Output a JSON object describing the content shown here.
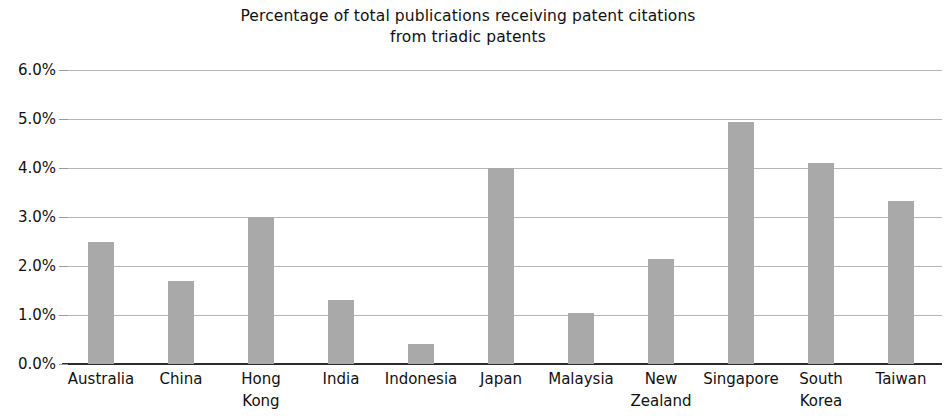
{
  "chart_data": {
    "type": "bar",
    "title": "Percentage of total publications receiving patent citations\nfrom triadic patents",
    "title_line1": "Percentage of total publications receiving patent citations",
    "title_line2": "from triadic patents",
    "xlabel": "",
    "ylabel": "",
    "ylim": [
      0,
      6
    ],
    "ytick_labels": [
      "6.0%",
      "5.0%",
      "4.0%",
      "3.0%",
      "2.0%",
      "1.0%",
      "0.0%"
    ],
    "ytick_values": [
      6.0,
      5.0,
      4.0,
      3.0,
      2.0,
      1.0,
      0.0
    ],
    "grid": true,
    "legend": "none",
    "bar_color": "#a9a9a9",
    "categories": [
      "Australia",
      "China",
      "Hong\nKong",
      "India",
      "Indonesia",
      "Japan",
      "Malaysia",
      "New\nZealand",
      "Singapore",
      "South\nKorea",
      "Taiwan"
    ],
    "values": [
      2.5,
      1.7,
      3.0,
      1.3,
      0.4,
      4.0,
      1.05,
      2.15,
      4.93,
      4.1,
      3.33
    ]
  }
}
